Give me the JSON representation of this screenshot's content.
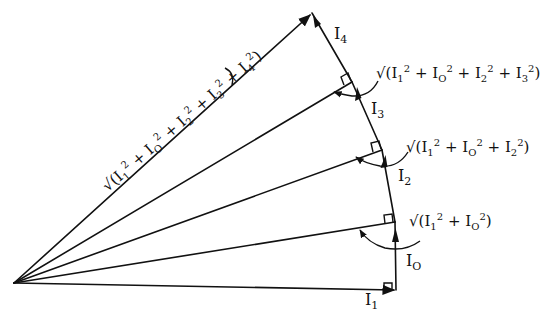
{
  "diagram": {
    "vertices": {
      "origin": [
        14,
        283
      ],
      "a": [
        396,
        290
      ],
      "b": [
        395,
        222
      ],
      "c": [
        382,
        150
      ],
      "d": [
        352,
        82
      ],
      "e": [
        312,
        13
      ]
    },
    "stroke_color": "#111111",
    "currents": [
      {
        "id": "I1",
        "base": "I",
        "sub": "1"
      },
      {
        "id": "I0",
        "base": "I",
        "sub": "O"
      },
      {
        "id": "I2",
        "base": "I",
        "sub": "2"
      },
      {
        "id": "I3",
        "base": "I",
        "sub": "3"
      },
      {
        "id": "I4",
        "base": "I",
        "sub": "4"
      }
    ],
    "resultants": [
      {
        "id": "r1",
        "text_root": "√(",
        "terms": [
          [
            "1",
            "2"
          ],
          [
            "O",
            "2"
          ]
        ],
        "close": ")"
      },
      {
        "id": "r2",
        "text_root": "√(",
        "terms": [
          [
            "1",
            "2"
          ],
          [
            "O",
            "2"
          ],
          [
            "2",
            "2"
          ]
        ],
        "close": ")"
      },
      {
        "id": "r3",
        "text_root": "√(",
        "terms": [
          [
            "1",
            "2"
          ],
          [
            "O",
            "2"
          ],
          [
            "2",
            "2"
          ],
          [
            "3",
            "2"
          ]
        ],
        "close": ")"
      },
      {
        "id": "r4",
        "text_root": "√(",
        "terms": [
          [
            "1",
            "2"
          ],
          [
            "O",
            "2"
          ],
          [
            "2",
            "2"
          ],
          [
            "3",
            "2"
          ],
          [
            "4",
            "2"
          ]
        ],
        "close": ")"
      }
    ],
    "labels": {
      "I1": {
        "base": "I",
        "sub": "1"
      },
      "I0": {
        "base": "I",
        "sub": "O"
      },
      "I2": {
        "base": "I",
        "sub": "2"
      },
      "I3": {
        "base": "I",
        "sub": "3"
      },
      "I4": {
        "base": "I",
        "sub": "4"
      },
      "r1_text": "√(I₁² + I₀²)",
      "r2_text": "√(I₁² + I₀² + I₂²)",
      "r3_text": "√(I₁² + I₀² + I₂² + I₃²)",
      "r4_text": "√(I₁² + I₀² + I₂² + I₃² + I₄²)",
      "sqrt": "√(",
      "plus": "+",
      "close": ")",
      "I": "I",
      "sq": "2",
      "s1": "1",
      "s0": "O",
      "s2": "2",
      "s3": "3",
      "s4": "4"
    }
  }
}
